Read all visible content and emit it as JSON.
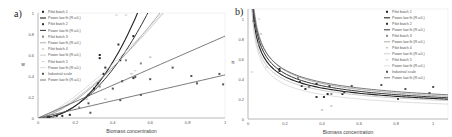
{
  "chart_data": [
    {
      "panel": "a)",
      "type": "scatter",
      "xlabel": "Biomass concentration",
      "ylabel": "w",
      "xlim": [
        0,
        1
      ],
      "ylim": [
        0,
        1
      ],
      "xticks": [
        "0",
        "0.2",
        "0.4",
        "0.6",
        "0.8",
        "1"
      ],
      "yticks": [
        "0",
        "0.2",
        "0.4",
        "0.6",
        "0.8",
        "1"
      ],
      "grid": false,
      "legend_position": "upper left",
      "legend": [
        "Pilot batch 1",
        "Power law fit (R²=0.)",
        "Pilot batch 2",
        "Power law fit (R²=0.)",
        "Pilot batch 3",
        "Power law fit (R²=0.)",
        "Pilot batch 4",
        "Power law fit (R²=0.)",
        "Pilot batch 5",
        "Power law fit (R²=0.)",
        "Industrial scale",
        "Power law fit (R²=0.)"
      ],
      "series": [
        {
          "name": "Pilot batch 1",
          "color": "#222222",
          "marker": "square",
          "points": [
            [
              0.05,
              0.01
            ],
            [
              0.1,
              0.02
            ],
            [
              0.17,
              0.03
            ],
            [
              0.3,
              0.28
            ],
            [
              0.33,
              0.6
            ],
            [
              0.33,
              0.57
            ],
            [
              0.35,
              0.42
            ],
            [
              0.51,
              0.78
            ]
          ],
          "fit": {
            "a": 4.0,
            "b": 2.2
          }
        },
        {
          "name": "Pilot batch 2",
          "color": "#333333",
          "marker": "square",
          "points": [
            [
              0.06,
              0.01
            ],
            [
              0.13,
              0.02
            ],
            [
              0.27,
              0.22
            ],
            [
              0.32,
              0.33
            ],
            [
              0.36,
              0.48
            ],
            [
              0.43,
              0.7
            ],
            [
              0.44,
              0.55
            ],
            [
              0.51,
              0.38
            ]
          ],
          "fit": {
            "a": 2.9,
            "b": 2.0
          }
        },
        {
          "name": "Pilot batch 3",
          "color": "#888888",
          "marker": "square",
          "points": [
            [
              0.08,
              0.01
            ],
            [
              0.22,
              0.1
            ],
            [
              0.33,
              0.3
            ],
            [
              0.47,
              0.55
            ],
            [
              0.55,
              0.52
            ]
          ],
          "fit": {
            "a": 1.9,
            "b": 1.5
          }
        },
        {
          "name": "Pilot batch 4",
          "color": "#aaaaaa",
          "marker": "dash",
          "points": [
            [
              0.09,
              0.01
            ],
            [
              0.26,
              0.18
            ],
            [
              0.36,
              0.18
            ],
            [
              0.5,
              0.42
            ],
            [
              0.6,
              0.58
            ]
          ],
          "fit": {
            "a": 1.75,
            "b": 1.4
          }
        },
        {
          "name": "Pilot batch 5",
          "color": "#c8c8c8",
          "marker": "dash",
          "points": [
            [
              0.04,
              0.01
            ],
            [
              0.2,
              0.08
            ],
            [
              0.42,
              0.98
            ],
            [
              0.47,
              0.98
            ],
            [
              0.52,
              0.45
            ]
          ],
          "fit": {
            "a": 1.7,
            "b": 1.3
          }
        },
        {
          "name": "Industrial scale",
          "color": "#555555",
          "marker": "square",
          "points": [
            [
              0.27,
              0.14
            ],
            [
              0.28,
              0.05
            ],
            [
              0.4,
              0.28
            ],
            [
              0.45,
              0.35
            ],
            [
              0.52,
              0.39
            ],
            [
              0.6,
              0.37
            ],
            [
              0.72,
              0.48
            ],
            [
              0.82,
              0.4
            ],
            [
              0.85,
              0.33
            ],
            [
              0.97,
              0.42
            ],
            [
              0.99,
              0.32
            ],
            [
              0.55,
              0.22
            ],
            [
              0.44,
              0.17
            ]
          ],
          "fit_lines": [
            {
              "a": 0.78,
              "b": 1.0
            },
            {
              "a": 0.41,
              "b": 1.0
            }
          ]
        }
      ]
    },
    {
      "panel": "b)",
      "type": "scatter",
      "xlabel": "Biomass concentration",
      "ylabel": "π",
      "xlim": [
        0,
        1.08
      ],
      "ylim": [
        0,
        1.1
      ],
      "xticks": [
        "0",
        "0.2",
        "0.4",
        "0.6",
        "0.8",
        "1"
      ],
      "yticks": [
        "0",
        "0.2",
        "0.4",
        "0.6",
        "0.8",
        "1"
      ],
      "grid": false,
      "legend_position": "upper right",
      "legend": [
        "Pilot batch 1",
        "Power law fit (R²=0.)",
        "Pilot batch 2",
        "Power law fit (R²=0.)",
        "Pilot batch 3",
        "Power law fit (R²=0.)",
        "Pilot batch 4",
        "Power law fit (R²=0.)",
        "Pilot batch 5",
        "Power law fit (R²=0.)",
        "Industrial scale",
        "Power law fit (R²=0.)"
      ],
      "series": [
        {
          "name": "Pilot batch 1",
          "color": "#222222",
          "marker": "square",
          "points": [
            [
              0.03,
              0.98
            ],
            [
              0.17,
              0.5
            ],
            [
              0.29,
              0.33
            ],
            [
              0.33,
              0.32
            ],
            [
              0.37,
              0.35
            ],
            [
              0.43,
              0.25
            ],
            [
              0.51,
              0.25
            ]
          ],
          "fit": {
            "a": 0.205,
            "b": -0.45
          }
        },
        {
          "name": "Pilot batch 2",
          "color": "#333333",
          "marker": "square",
          "points": [
            [
              0.17,
              0.48
            ],
            [
              0.28,
              0.37
            ],
            [
              0.31,
              0.3
            ],
            [
              0.37,
              0.22
            ],
            [
              0.41,
              0.22
            ],
            [
              0.44,
              0.33
            ],
            [
              0.52,
              0.27
            ]
          ],
          "fit": {
            "a": 0.22,
            "b": -0.45
          }
        },
        {
          "name": "Pilot batch 3",
          "color": "#888888",
          "marker": "square",
          "points": [
            [
              0.06,
              0.75
            ],
            [
              0.27,
              0.41
            ],
            [
              0.33,
              0.32
            ],
            [
              0.45,
              0.25
            ]
          ],
          "fit": {
            "a": 0.235,
            "b": -0.45
          }
        },
        {
          "name": "Pilot batch 4",
          "color": "#aaaaaa",
          "marker": "dash",
          "points": [
            [
              0.07,
              0.85
            ],
            [
              0.4,
              0.09
            ],
            [
              0.45,
              0.13
            ]
          ],
          "fit": {
            "a": 0.19,
            "b": -0.45
          }
        },
        {
          "name": "Pilot batch 5",
          "color": "#c8c8c8",
          "marker": "dash",
          "points": [
            [
              0.02,
              0.47
            ],
            [
              0.06,
              1.0
            ],
            [
              0.1,
              0.52
            ]
          ],
          "fit": {
            "a": 0.155,
            "b": -0.5
          }
        },
        {
          "name": "Industrial scale",
          "color": "#555555",
          "marker": "square",
          "points": [
            [
              0.56,
              0.33
            ],
            [
              0.72,
              0.34
            ],
            [
              0.85,
              0.3
            ],
            [
              0.98,
              0.26
            ],
            [
              1.0,
              0.32
            ],
            [
              0.81,
              0.2
            ]
          ],
          "fit": {
            "a": 0.25,
            "b": -0.42
          }
        }
      ]
    }
  ],
  "panels": {
    "a": {
      "label": "a)",
      "xlabel": "Biomass concentration",
      "ylabel": "w"
    },
    "b": {
      "label": "b)",
      "xlabel": "Biomass concentration",
      "ylabel": "π"
    }
  }
}
